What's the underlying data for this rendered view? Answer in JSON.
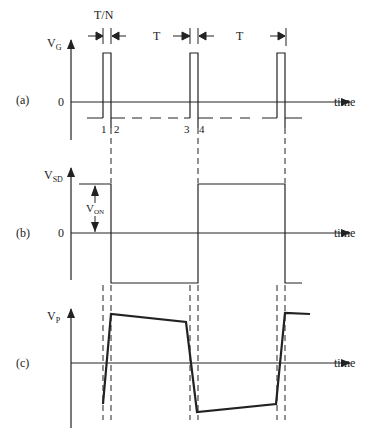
{
  "diagram": {
    "top_labels": {
      "pulse_width": "T/N",
      "period_1": "T",
      "period_2": "T"
    },
    "panel_a": {
      "tag": "(a)",
      "ylabel_main": "V",
      "ylabel_sub": "G",
      "zero": "0",
      "xlabel": "time",
      "points": [
        "1",
        "2",
        "3",
        "4"
      ]
    },
    "panel_b": {
      "tag": "(b)",
      "ylabel_main": "V",
      "ylabel_sub": "SD",
      "zero": "0",
      "xlabel": "time",
      "von_main": "V",
      "von_sub": "ON"
    },
    "panel_c": {
      "tag": "(c)",
      "ylabel_main": "V",
      "ylabel_sub": "P",
      "xlabel": "time"
    },
    "colors": {
      "line": "#222222",
      "background": "#ffffff"
    }
  }
}
